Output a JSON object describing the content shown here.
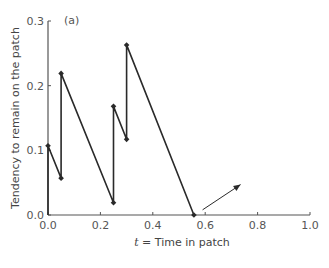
{
  "chart_data": {
    "type": "line",
    "title": "",
    "panel_label": "(a)",
    "xlabel_var": "t",
    "xlabel_rest": " = Time in patch",
    "xlabel": "t = Time in patch",
    "ylabel": "Tendency to remain on the patch",
    "xlim": [
      0.0,
      1.0
    ],
    "ylim": [
      0.0,
      0.3
    ],
    "xticks": [
      "0.0",
      "0.2",
      "0.4",
      "0.6",
      "0.8",
      "1.0"
    ],
    "yticks": [
      "0.0",
      "0.1",
      "0.2",
      "0.3"
    ],
    "grid": false,
    "series": [
      {
        "name": "tendency",
        "points": [
          {
            "x": 0.0,
            "y": 0.0
          },
          {
            "x": 0.0,
            "y": 0.107
          },
          {
            "x": 0.05,
            "y": 0.057
          },
          {
            "x": 0.05,
            "y": 0.219
          },
          {
            "x": 0.25,
            "y": 0.019
          },
          {
            "x": 0.25,
            "y": 0.168
          },
          {
            "x": 0.3,
            "y": 0.117
          },
          {
            "x": 0.3,
            "y": 0.263
          },
          {
            "x": 0.557,
            "y": 0.0
          }
        ],
        "markers": [
          {
            "x": 0.0,
            "y": 0.107
          },
          {
            "x": 0.05,
            "y": 0.057
          },
          {
            "x": 0.05,
            "y": 0.219
          },
          {
            "x": 0.25,
            "y": 0.019
          },
          {
            "x": 0.25,
            "y": 0.168
          },
          {
            "x": 0.3,
            "y": 0.117
          },
          {
            "x": 0.3,
            "y": 0.263
          },
          {
            "x": 0.557,
            "y": 0.0
          }
        ]
      }
    ],
    "annotations": [
      {
        "type": "arrow",
        "from": {
          "x": 0.59,
          "y": 0.008
        },
        "to": {
          "x": 0.735,
          "y": 0.047
        }
      }
    ],
    "colors": {
      "line": "#2a2a2a",
      "axis": "#555555",
      "text": "#555555"
    }
  }
}
